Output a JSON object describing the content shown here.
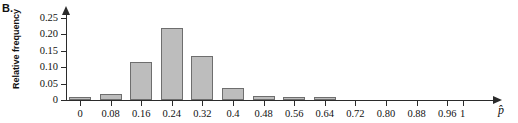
{
  "panel": {
    "label": "B."
  },
  "axes": {
    "ylabel": "Relative frequency",
    "xlabel": "p̂",
    "y_ticks": [
      "0",
      "0.05",
      "0.10",
      "0.15",
      "0.20",
      "0.25"
    ],
    "y_tick_values": [
      0,
      0.05,
      0.1,
      0.15,
      0.2,
      0.25
    ],
    "x_ticks": [
      "0",
      "0.08",
      "0.16",
      "0.24",
      "0.32",
      "0.4",
      "0.48",
      "0.56",
      "0.64",
      "0.72",
      "0.80",
      "0.88",
      "0.96",
      "1"
    ],
    "x_tick_values": [
      0,
      0.08,
      0.16,
      0.24,
      0.32,
      0.4,
      0.48,
      0.56,
      0.64,
      0.72,
      0.8,
      0.88,
      0.96,
      1
    ]
  },
  "style": {
    "bar_fill": "#bdbdbd",
    "bar_stroke": "#6e6e6e",
    "axis_color": "#2b2b2b",
    "background": "#ffffff"
  },
  "chart_data": {
    "type": "bar",
    "title": "",
    "subtitle": "",
    "xlabel": "p̂",
    "ylabel": "Relative frequency",
    "xlim": [
      -0.04,
      1.04
    ],
    "ylim": [
      0,
      0.27
    ],
    "grid": false,
    "legend": null,
    "categories": [
      "0",
      "0.08",
      "0.16",
      "0.24",
      "0.32",
      "0.4",
      "0.48",
      "0.56",
      "0.64",
      "0.72",
      "0.80",
      "0.88",
      "0.96",
      "1"
    ],
    "values": [
      0.008,
      0.017,
      0.115,
      0.219,
      0.135,
      0.037,
      0.012,
      0.01,
      0.01,
      0,
      0,
      0,
      0,
      0
    ]
  }
}
